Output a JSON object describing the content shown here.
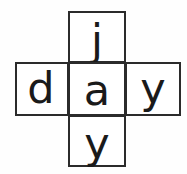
{
  "figure": {
    "kind": "letter-cross-diagram",
    "shape": "plus",
    "background_color": "#ffffff",
    "border_color": "#2b2b2b",
    "text_color": "#1a1a1a",
    "horizontal_word": "day",
    "vertical_word": "jay"
  },
  "cells": {
    "top": {
      "letter": "j",
      "position": "top"
    },
    "left": {
      "letter": "d",
      "position": "left"
    },
    "center": {
      "letter": "a",
      "position": "center"
    },
    "right": {
      "letter": "y",
      "position": "right"
    },
    "bottom": {
      "letter": "y",
      "position": "bottom"
    }
  }
}
